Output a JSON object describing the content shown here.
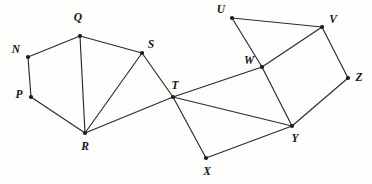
{
  "figure": {
    "width": 372,
    "height": 184,
    "background_color": "#fdfdfb",
    "stroke_color": "#2b2b2b",
    "vertex_color": "#1a1a1a",
    "label_color": "#151515"
  },
  "vertices": [
    {
      "id": "N",
      "label": "N",
      "x": 28,
      "y": 57,
      "label_x": 16,
      "label_y": 50
    },
    {
      "id": "P",
      "label": "P",
      "x": 31,
      "y": 97,
      "label_x": 19,
      "label_y": 95
    },
    {
      "id": "Q",
      "label": "Q",
      "x": 80,
      "y": 36,
      "label_x": 78,
      "label_y": 18
    },
    {
      "id": "R",
      "label": "R",
      "x": 85,
      "y": 133,
      "label_x": 85,
      "label_y": 147
    },
    {
      "id": "S",
      "label": "S",
      "x": 142,
      "y": 53,
      "label_x": 151,
      "label_y": 45
    },
    {
      "id": "T",
      "label": "T",
      "x": 173,
      "y": 97,
      "label_x": 175,
      "label_y": 86
    },
    {
      "id": "U",
      "label": "U",
      "x": 232,
      "y": 18,
      "label_x": 221,
      "label_y": 10
    },
    {
      "id": "V",
      "label": "V",
      "x": 322,
      "y": 27,
      "label_x": 333,
      "label_y": 20
    },
    {
      "id": "W",
      "label": "W",
      "x": 262,
      "y": 67,
      "label_x": 249,
      "label_y": 61
    },
    {
      "id": "X",
      "label": "X",
      "x": 206,
      "y": 158,
      "label_x": 207,
      "label_y": 172
    },
    {
      "id": "Y",
      "label": "Y",
      "x": 292,
      "y": 126,
      "label_x": 295,
      "label_y": 139
    },
    {
      "id": "Z",
      "label": "Z",
      "x": 348,
      "y": 78,
      "label_x": 359,
      "label_y": 78
    }
  ],
  "edges": [
    {
      "from": "N",
      "to": "Q"
    },
    {
      "from": "N",
      "to": "P"
    },
    {
      "from": "P",
      "to": "R"
    },
    {
      "from": "Q",
      "to": "R"
    },
    {
      "from": "Q",
      "to": "S"
    },
    {
      "from": "S",
      "to": "R"
    },
    {
      "from": "S",
      "to": "T"
    },
    {
      "from": "R",
      "to": "T"
    },
    {
      "from": "T",
      "to": "W"
    },
    {
      "from": "T",
      "to": "Y"
    },
    {
      "from": "T",
      "to": "X"
    },
    {
      "from": "X",
      "to": "Y"
    },
    {
      "from": "U",
      "to": "V"
    },
    {
      "from": "U",
      "to": "W"
    },
    {
      "from": "V",
      "to": "W"
    },
    {
      "from": "V",
      "to": "Z"
    },
    {
      "from": "W",
      "to": "Y"
    },
    {
      "from": "Y",
      "to": "Z"
    }
  ]
}
